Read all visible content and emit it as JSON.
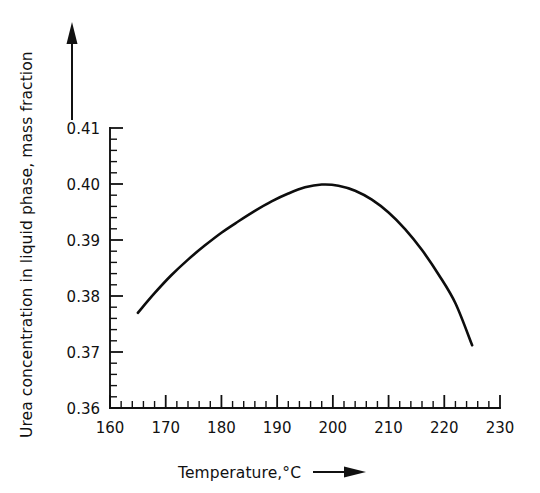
{
  "chart_data": {
    "type": "line",
    "title": "",
    "xlabel": "Temperature,°C",
    "ylabel": "Urea concentration in liquid phase, mass fraction",
    "xlim": [
      160,
      230
    ],
    "ylim": [
      0.36,
      0.41
    ],
    "xticks": [
      160,
      170,
      180,
      190,
      200,
      210,
      220,
      230
    ],
    "xtick_labels": [
      "160",
      "170",
      "180",
      "190",
      "200",
      "210",
      "220",
      "230"
    ],
    "yticks": [
      0.36,
      0.37,
      0.38,
      0.39,
      0.4,
      0.41
    ],
    "ytick_labels": [
      "0.36",
      "0.37",
      "0.38",
      "0.39",
      "0.40",
      "0.41"
    ],
    "x_minor_step": 2,
    "y_minor_step": 0.002,
    "grid": false,
    "legend": null,
    "legend_position": "none",
    "line_color": "#0d0d0d",
    "background_color": "#ffffff",
    "x_axis_arrow": true,
    "y_axis_arrow": true,
    "series": [
      {
        "name": "Urea concentration",
        "x": [
          165,
          168,
          171,
          174,
          177,
          180,
          183,
          186,
          189,
          192,
          195,
          198,
          201,
          204,
          207,
          210,
          213,
          216,
          219,
          222,
          225
        ],
        "values": [
          0.377,
          0.3805,
          0.3837,
          0.3865,
          0.389,
          0.3913,
          0.3933,
          0.3952,
          0.3969,
          0.3983,
          0.3994,
          0.3999,
          0.3997,
          0.3988,
          0.3972,
          0.3949,
          0.3919,
          0.3882,
          0.3838,
          0.3787,
          0.3712
        ]
      }
    ],
    "annotations": {
      "peak_x": 193,
      "peak_y": 0.4,
      "start_x": 165,
      "start_y": 0.377,
      "end_x": 225,
      "end_y": 0.371
    }
  }
}
